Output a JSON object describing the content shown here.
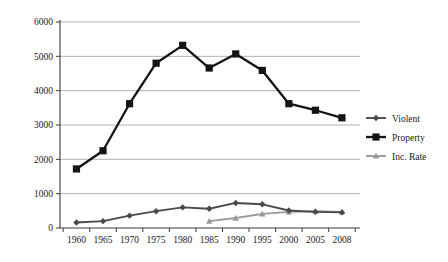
{
  "chart_data": {
    "type": "line",
    "title": "",
    "subtitle": "",
    "xlabel": "",
    "ylabel": "",
    "categories": [
      "1960",
      "1965",
      "1970",
      "1975",
      "1980",
      "1985",
      "1990",
      "1995",
      "2000",
      "2005",
      "2008"
    ],
    "x": [
      1960,
      1965,
      1970,
      1975,
      1980,
      1985,
      1990,
      1995,
      2000,
      2005,
      2008
    ],
    "ylim": [
      0,
      6000
    ],
    "ytick_labels": [
      "0",
      "1000",
      "2000",
      "3000",
      "4000",
      "5000",
      "6000"
    ],
    "yticks": [
      0,
      1000,
      2000,
      3000,
      4000,
      5000,
      6000
    ],
    "grid": true,
    "grid_axis": "y",
    "legend_position": "right",
    "series": [
      {
        "name": "Violent",
        "color": "#4a4a4a",
        "marker": "diamond",
        "values": [
          160,
          200,
          360,
          490,
          600,
          560,
          730,
          690,
          510,
          470,
          455
        ]
      },
      {
        "name": "Property",
        "color": "#141414",
        "marker": "square",
        "values": [
          1720,
          2250,
          3620,
          4800,
          5320,
          4660,
          5070,
          4590,
          3620,
          3430,
          3210
        ]
      },
      {
        "name": "Inc. Rate",
        "color": "#9a9a9a",
        "marker": "triangle",
        "values": [
          null,
          null,
          null,
          null,
          null,
          200,
          290,
          410,
          470,
          490,
          470
        ]
      }
    ]
  },
  "legend": {
    "items": [
      {
        "label": "Violent"
      },
      {
        "label": "Property"
      },
      {
        "label": "Inc. Rate"
      }
    ]
  }
}
